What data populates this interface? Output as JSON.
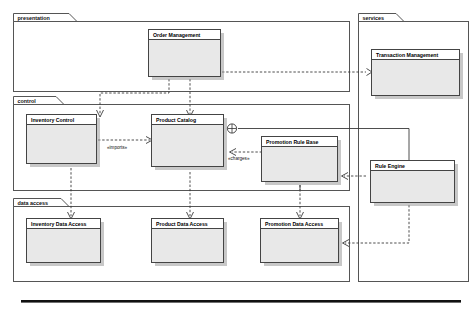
{
  "diagram": {
    "packages": [
      {
        "id": "presentation",
        "label": "presentation"
      },
      {
        "id": "control",
        "label": "control"
      },
      {
        "id": "data_access",
        "label": "data access"
      },
      {
        "id": "services",
        "label": "services"
      }
    ],
    "components": [
      {
        "id": "order_management",
        "label": "Order Management",
        "package": "presentation"
      },
      {
        "id": "inventory_control",
        "label": "Inventory Control",
        "package": "control"
      },
      {
        "id": "product_catalog",
        "label": "Product Catalog",
        "package": "control"
      },
      {
        "id": "promotion_rule_base",
        "label": "Promotion Rule Base",
        "package": "control"
      },
      {
        "id": "inventory_data_access",
        "label": "Inventory Data Access",
        "package": "data_access"
      },
      {
        "id": "product_data_access",
        "label": "Product Data Access",
        "package": "data_access"
      },
      {
        "id": "promotion_data_access",
        "label": "Promotion Data Access",
        "package": "data_access"
      },
      {
        "id": "transaction_management",
        "label": "Transaction Management",
        "package": "services"
      },
      {
        "id": "rule_engine",
        "label": "Rule Engine",
        "package": "services"
      }
    ],
    "stereotypes": [
      {
        "id": "imports",
        "label": "«imports»"
      },
      {
        "id": "charges",
        "label": "«charges»"
      }
    ],
    "colors": {
      "component_fill": "#e8e8e8",
      "component_stroke": "#444444",
      "package_stroke": "#555555",
      "connector": "#3a3a3a",
      "background": "#ffffff"
    }
  }
}
